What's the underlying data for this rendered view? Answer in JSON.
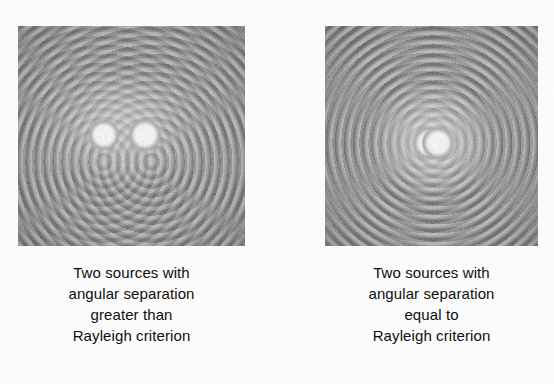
{
  "figure": {
    "kind": "diffraction-pattern-comparison",
    "background_color": "#fdfdfd",
    "panels": [
      {
        "id": "left",
        "pattern_tone": "#8d8d8d",
        "source_count": 2,
        "resolved": "resolved",
        "caption_lines": [
          "Two sources with",
          "angular separation",
          "greater than",
          "Rayleigh criterion"
        ]
      },
      {
        "id": "right",
        "pattern_tone": "#8d8d8d",
        "source_count": 2,
        "resolved": "marginally-resolved",
        "caption_lines": [
          "Two sources with",
          "angular separation",
          "equal to",
          "Rayleigh criterion"
        ]
      }
    ]
  }
}
